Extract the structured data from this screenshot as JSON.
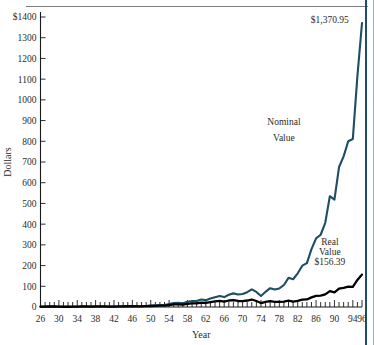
{
  "chart_data": {
    "type": "line",
    "title": "",
    "xlabel": "Year",
    "ylabel": "Dollars",
    "xlim": [
      26,
      96
    ],
    "ylim": [
      0,
      1400
    ],
    "ytick_values": [
      0,
      100,
      200,
      300,
      400,
      500,
      600,
      700,
      800,
      900,
      1000,
      1100,
      1200,
      1300,
      1400
    ],
    "ytick_labels": [
      "0",
      "100",
      "200",
      "300",
      "400",
      "500",
      "600",
      "700",
      "800",
      "900",
      "1000",
      "1100",
      "1200",
      "1300",
      "$1400"
    ],
    "xtick_labels": [
      "26",
      "30",
      "34",
      "38",
      "42",
      "46",
      "50",
      "54",
      "58",
      "62",
      "66",
      "70",
      "74",
      "78",
      "82",
      "86",
      "90",
      "94",
      "96"
    ],
    "xtick_values": [
      26,
      30,
      34,
      38,
      42,
      46,
      50,
      54,
      58,
      62,
      66,
      70,
      74,
      78,
      82,
      86,
      90,
      94,
      96
    ],
    "minor_xticks_every": 1,
    "grid": false,
    "legend": "annotations",
    "annotations": [
      {
        "name": "nominal-peak-label",
        "text": "$1,370.95",
        "x": 89,
        "y": 1371
      },
      {
        "name": "nominal-series-label-line1",
        "text": "Nominal",
        "x": 79,
        "y": 880
      },
      {
        "name": "nominal-series-label-line2",
        "text": "Value",
        "x": 79,
        "y": 800
      },
      {
        "name": "real-series-label-line1",
        "text": "Real",
        "x": 89,
        "y": 300
      },
      {
        "name": "real-series-label-line2",
        "text": "Value",
        "x": 89,
        "y": 252
      },
      {
        "name": "real-peak-label",
        "text": "$156.39",
        "x": 89,
        "y": 205
      }
    ],
    "series": [
      {
        "name": "Nominal Value",
        "color": "#1d4e63",
        "x": [
          26,
          27,
          28,
          29,
          30,
          31,
          32,
          33,
          34,
          35,
          36,
          37,
          38,
          39,
          40,
          41,
          42,
          43,
          44,
          45,
          46,
          47,
          48,
          49,
          50,
          51,
          52,
          53,
          54,
          55,
          56,
          57,
          58,
          59,
          60,
          61,
          62,
          63,
          64,
          65,
          66,
          67,
          68,
          69,
          70,
          71,
          72,
          73,
          74,
          75,
          76,
          77,
          78,
          79,
          80,
          81,
          82,
          83,
          84,
          85,
          86,
          87,
          88,
          89,
          90,
          91,
          92,
          93,
          94,
          95,
          96
        ],
        "values": [
          10.0,
          11.6,
          16.2,
          14.9,
          11.2,
          6.4,
          5.9,
          9.0,
          8.9,
          13.2,
          17.7,
          11.5,
          15.0,
          14.9,
          13.5,
          11.9,
          14.3,
          18.0,
          21.5,
          29.4,
          27.0,
          28.5,
          30.0,
          35.6,
          46.9,
          58.1,
          68.8,
          68.1,
          103.8,
          136.5,
          145.3,
          129.6,
          185.9,
          208.2,
          209.2,
          265.5,
          242.2,
          297.5,
          346.1,
          389.3,
          350.2,
          434.2,
          481.8,
          441.1,
          458.7,
          524.2,
          623.7,
          532.2,
          391.1,
          536.8,
          665.0,
          617.1,
          657.6,
          778.9,
          1031.4,
          981.0,
          1191.9,
          1460.2,
          1552.0,
          2045.2,
          2426.6,
          2554.2,
          2978.3,
          3917.7,
          3796.6,
          4948.5,
          5325.1,
          5861.5,
          5937.3,
          8163.8,
          10040.0
        ]
      },
      {
        "name": "Real Value",
        "color": "#000000",
        "x": [
          26,
          27,
          28,
          29,
          30,
          31,
          32,
          33,
          34,
          35,
          36,
          37,
          38,
          39,
          40,
          41,
          42,
          43,
          44,
          45,
          46,
          47,
          48,
          49,
          50,
          51,
          52,
          53,
          54,
          55,
          56,
          57,
          58,
          59,
          60,
          61,
          62,
          63,
          64,
          65,
          66,
          67,
          68,
          69,
          70,
          71,
          72,
          73,
          74,
          75,
          76,
          77,
          78,
          79,
          80,
          81,
          82,
          83,
          84,
          85,
          86,
          87,
          88,
          89,
          90,
          91,
          92,
          93,
          94,
          95,
          96
        ],
        "values": [
          10.0,
          11.8,
          16.5,
          15.2,
          11.7,
          7.4,
          7.6,
          11.4,
          11.1,
          16.2,
          21.4,
          13.4,
          17.8,
          17.7,
          16.0,
          12.9,
          13.9,
          16.5,
          19.3,
          25.8,
          21.9,
          20.2,
          19.8,
          23.7,
          29.0,
          33.3,
          38.4,
          37.8,
          57.7,
          75.3,
          78.6,
          67.8,
          95.0,
          105.6,
          104.3,
          131.1,
          118.3,
          143.5,
          164.7,
          182.0,
          159.4,
          192.0,
          204.6,
          177.8,
          174.9,
          191.6,
          221.2,
          177.7,
          117.7,
          148.0,
          173.4,
          151.2,
          149.8,
          159.5,
          186.1,
          160.6,
          183.8,
          218.0,
          222.2,
          282.8,
          329.3,
          334.4,
          374.2,
          469.9,
          432.1,
          540.8,
          565.0,
          604.1,
          596.8,
          798.5,
          956.4
        ]
      }
    ],
    "final_values": {
      "nominal": "$1,370.95",
      "real": "$156.39"
    }
  }
}
